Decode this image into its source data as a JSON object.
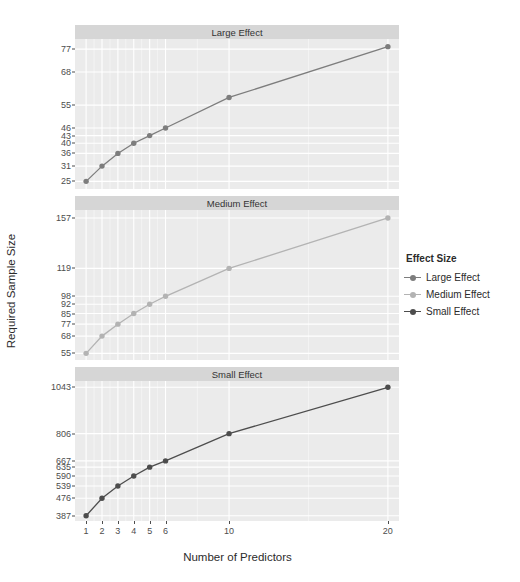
{
  "chart_data": {
    "type": "line",
    "title": "",
    "xlabel": "Number of Predictors",
    "ylabel": "Required Sample Size",
    "x": [
      1,
      2,
      3,
      4,
      5,
      6,
      10,
      20
    ],
    "xticklabels": [
      "1",
      "2",
      "3",
      "4",
      "5",
      "6",
      "10",
      "20"
    ],
    "facet_layout": "3 rows x 1 column",
    "legend_position": "right",
    "grid": true,
    "series": [
      {
        "name": "Large Effect",
        "facet": "Large Effect",
        "color": "#7d7d7d",
        "values": [
          25,
          31,
          36,
          40,
          43,
          46,
          58,
          78
        ],
        "yticks": [
          25,
          31,
          36,
          40,
          43,
          46,
          55,
          68,
          77
        ],
        "yticklabels": [
          "25",
          "31",
          "36",
          "40",
          "43",
          "46",
          "55",
          "68",
          "77"
        ],
        "ylim": [
          22,
          81
        ]
      },
      {
        "name": "Medium Effect",
        "facet": "Medium Effect",
        "color": "#b3b3b3",
        "values": [
          55,
          68,
          77,
          85,
          92,
          98,
          119,
          157
        ],
        "yticks": [
          55,
          68,
          77,
          85,
          92,
          98,
          119,
          157
        ],
        "yticklabels": [
          "55",
          "68",
          "77",
          "85",
          "92",
          "98",
          "119",
          "157"
        ],
        "ylim": [
          50,
          163
        ]
      },
      {
        "name": "Small Effect",
        "facet": "Small Effect",
        "color": "#4d4d4d",
        "values": [
          387,
          476,
          539,
          590,
          635,
          667,
          806,
          1043
        ],
        "yticks": [
          387,
          476,
          539,
          590,
          635,
          667,
          806,
          1043
        ],
        "yticklabels": [
          "387",
          "476",
          "539",
          "590",
          "635",
          "667",
          "806",
          "1043"
        ],
        "ylim": [
          360,
          1075
        ]
      }
    ]
  },
  "legend": {
    "title": "Effect Size",
    "items": [
      {
        "label": "Large Effect",
        "color": "#7d7d7d"
      },
      {
        "label": "Medium Effect",
        "color": "#b3b3b3"
      },
      {
        "label": "Small Effect",
        "color": "#4d4d4d"
      }
    ]
  },
  "panels": [
    {
      "strip": "Large Effect"
    },
    {
      "strip": "Medium Effect"
    },
    {
      "strip": "Small Effect"
    }
  ],
  "axes": {
    "x_title": "Number of Predictors",
    "y_title": "Required Sample Size"
  },
  "style": {
    "panel_background": "#ebebeb",
    "grid_color": "#ffffff",
    "strip_background": "#d6d6d6",
    "text_color": "#2b2b2b",
    "tick_color": "#4d4d4d"
  }
}
